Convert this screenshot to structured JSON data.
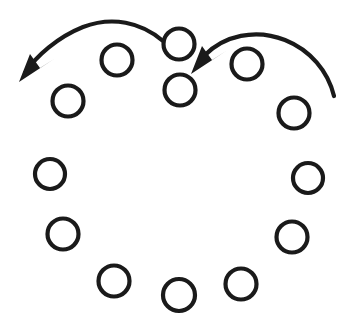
{
  "figure": {
    "type": "diagram",
    "width": 351,
    "height": 327,
    "background_color": "#ffffff",
    "stroke_color": "#1a1a1a",
    "circle_stroke_width": 4.2,
    "arrow_stroke_width": 4.2
  },
  "circles": {
    "label": "circle-node",
    "count": 13,
    "items": [
      {
        "name": "circle-top-center",
        "cx": 179,
        "cy": 44,
        "r": 15.5
      },
      {
        "name": "circle-top-center-lower",
        "cx": 180,
        "cy": 90,
        "r": 15.5
      },
      {
        "name": "circle-upper-left-1",
        "cx": 117,
        "cy": 60,
        "r": 15.5
      },
      {
        "name": "circle-upper-left-2",
        "cx": 68,
        "cy": 101,
        "r": 15.5
      },
      {
        "name": "circle-mid-left-1",
        "cx": 50,
        "cy": 174,
        "r": 15.0
      },
      {
        "name": "circle-mid-left-2",
        "cx": 63,
        "cy": 234,
        "r": 15.5
      },
      {
        "name": "circle-bottom-left",
        "cx": 114,
        "cy": 281,
        "r": 15.5
      },
      {
        "name": "circle-bottom-center",
        "cx": 179,
        "cy": 295,
        "r": 16.0
      },
      {
        "name": "circle-bottom-right",
        "cx": 241,
        "cy": 284,
        "r": 15.5
      },
      {
        "name": "circle-mid-right-2",
        "cx": 292,
        "cy": 237,
        "r": 15.5
      },
      {
        "name": "circle-mid-right-1",
        "cx": 308,
        "cy": 178,
        "r": 15.0
      },
      {
        "name": "circle-upper-right-2",
        "cx": 294,
        "cy": 113,
        "r": 15.5
      },
      {
        "name": "circle-upper-right-1",
        "cx": 247,
        "cy": 64,
        "r": 15.5
      }
    ]
  },
  "arrows": {
    "label": "directional-arrow",
    "count": 2,
    "items": [
      {
        "name": "arrow-left-counterclockwise",
        "direction": "left",
        "tail": {
          "x": 163,
          "y": 41
        },
        "tip": {
          "x": 19,
          "y": 82
        },
        "path": "M163,41 C141,22 112,16 83,27 C58,37 36,56 25,73",
        "head_points": "19,82 30,54 40,68 54,59"
      },
      {
        "name": "arrow-right-counterclockwise",
        "direction": "left",
        "tail": {
          "x": 334,
          "y": 96
        },
        "tip": {
          "x": 191,
          "y": 74
        },
        "path": "M334,96 C328,71 310,50 285,40 C255,28 224,36 205,55",
        "head_points": "191,74 202,46 212,60 226,51"
      }
    ]
  }
}
